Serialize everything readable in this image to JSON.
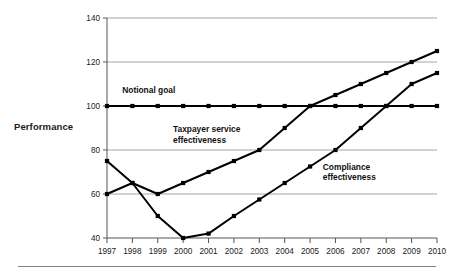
{
  "figure": {
    "y_axis_title": "Performance",
    "footer_rule": true
  },
  "chart_data": {
    "type": "line",
    "title": "",
    "xlabel": "",
    "ylabel": "Performance",
    "x": [
      1997,
      1998,
      1999,
      2000,
      2001,
      2002,
      2003,
      2004,
      2005,
      2006,
      2007,
      2008,
      2009,
      2010
    ],
    "categories": [
      "1997",
      "1998",
      "1999",
      "2000",
      "2001",
      "2002",
      "2003",
      "2004",
      "2005",
      "2006",
      "2007",
      "2008",
      "2009",
      "2010"
    ],
    "xlim": [
      1997,
      2010
    ],
    "ylim": [
      40,
      140
    ],
    "yticks": [
      40,
      60,
      80,
      100,
      120,
      140
    ],
    "ytick_labels": [
      "40",
      "60",
      "80",
      "100",
      "120",
      "140"
    ],
    "grid": "horizontal",
    "legend": "inline-annotations",
    "marker": "square",
    "series": [
      {
        "name": "Notional goal",
        "values": [
          100,
          100,
          100,
          100,
          100,
          100,
          100,
          100,
          100,
          100,
          100,
          100,
          100,
          100
        ],
        "color": "#000000"
      },
      {
        "name": "Taxpayer service effectiveness",
        "values": [
          60,
          65,
          60,
          65,
          70,
          75,
          80,
          90,
          100,
          105,
          110,
          115,
          120,
          125
        ],
        "color": "#000000"
      },
      {
        "name": "Compliance effectiveness",
        "values": [
          75,
          65,
          50,
          40,
          42,
          50,
          57.5,
          65,
          72.5,
          80,
          90,
          100,
          110,
          115
        ],
        "color": "#000000"
      }
    ],
    "annotations": [
      {
        "text": "Notional goal",
        "x": 1997.6,
        "y": 106
      },
      {
        "text_line1": "Taxpayer service",
        "text_line2": "effectiveness",
        "x": 1999.6,
        "y": 88
      },
      {
        "text_line1": "Compliance",
        "text_line2": "effectiveness",
        "x": 2005.5,
        "y": 71
      }
    ]
  }
}
